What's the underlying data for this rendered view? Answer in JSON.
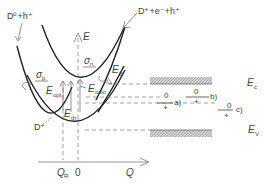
{
  "diagram": {
    "type": "configuration-coordinate diagram",
    "curves": {
      "upper_left": "D⁰+h⁺",
      "upper_right": "D⁺+e⁻+h⁺",
      "lower": "D⁺"
    },
    "axes": {
      "y_label": "E",
      "x_label": "Q",
      "x_ticks": [
        "Q₀",
        "0"
      ],
      "x_tick_qr_main": "Q",
      "x_tick_qr_sub": "R"
    },
    "annotations": {
      "sigma_p_main": "σ",
      "sigma_p_sub": "p",
      "sigma_n_main": "σ",
      "sigma_n_sub": "n",
      "e_opt_main": "E",
      "e_opt_sub": "opt",
      "e_calc_main": "E",
      "e_calc_sub": "calc",
      "e_b_main": "E",
      "e_b_sub": "B",
      "e_th_main": "E",
      "e_th_sub": "th",
      "e_th_subsub": "t"
    },
    "bands": {
      "conduction_main": "E",
      "conduction_sub": "c",
      "valence_main": "E",
      "valence_sub": "V"
    },
    "levels": [
      {
        "id": "a",
        "top": "0",
        "bottom": "+",
        "label": "a)"
      },
      {
        "id": "b",
        "top": "0",
        "bottom": "+",
        "label": "b)"
      },
      {
        "id": "c",
        "top": "0",
        "bottom": "+",
        "label": "c)"
      }
    ],
    "colors": {
      "curve": "#222222",
      "band_fill": "#bdbdbd",
      "dash": "#888888"
    }
  }
}
